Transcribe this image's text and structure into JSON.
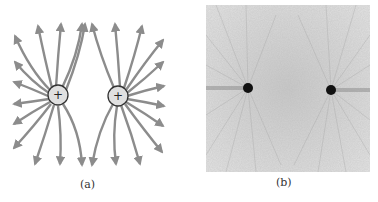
{
  "figure": {
    "panels": [
      {
        "id": "a",
        "label": "(a)",
        "description": "Electric field lines of two equal positive point charges",
        "charges": [
          {
            "sign": "+",
            "x": 58,
            "y": 95
          },
          {
            "sign": "+",
            "x": 118,
            "y": 96
          }
        ],
        "line_color": "#8c8c8c"
      },
      {
        "id": "b",
        "label": "(b)",
        "description": "Photograph of field pattern around two like charges",
        "charges": [
          {
            "x": 248,
            "y": 88
          },
          {
            "x": 331,
            "y": 90
          }
        ]
      }
    ]
  }
}
